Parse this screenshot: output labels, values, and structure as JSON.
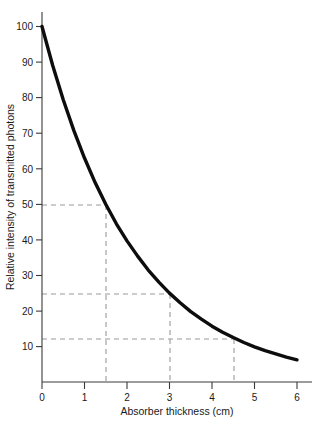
{
  "chart_data": {
    "type": "line",
    "title": "",
    "subtitle": "",
    "xlabel": "Absorber thickness (cm)",
    "ylabel": "Relative intensity of transmitted photons",
    "xlim": [
      0,
      6
    ],
    "ylim": [
      0,
      100
    ],
    "grid": false,
    "legend": false,
    "x_ticks": [
      0,
      1,
      2,
      3,
      4,
      5,
      6
    ],
    "x_tick_labels": [
      "0",
      "1",
      "2",
      "3",
      "4",
      "5",
      "6"
    ],
    "y_ticks": [
      10,
      20,
      30,
      40,
      50,
      60,
      70,
      80,
      90,
      100
    ],
    "y_tick_labels": [
      "10",
      "20",
      "30",
      "40",
      "50",
      "60",
      "70",
      "80",
      "90",
      "100"
    ],
    "series": [
      {
        "name": "Relative intensity of transmitted photons",
        "color": "#0d0d0d",
        "x": [
          0,
          0.25,
          0.5,
          0.75,
          1,
          1.25,
          1.5,
          1.75,
          2,
          2.25,
          2.5,
          2.75,
          3,
          3.25,
          3.5,
          3.75,
          4,
          4.25,
          4.5,
          4.75,
          5,
          5.25,
          5.5,
          5.75,
          6
        ],
        "y": [
          100,
          89.1,
          79.4,
          70.7,
          63,
          56.1,
          50,
          44.5,
          39.7,
          35.4,
          31.5,
          28.1,
          25,
          22.3,
          19.8,
          17.7,
          15.7,
          14,
          12.5,
          11.1,
          9.9,
          8.8,
          7.9,
          7,
          6.25
        ]
      }
    ],
    "annotations": {
      "guide_color": "#9a9a9a",
      "guide_style": "dashed",
      "half_value_layer_cm": 1.5,
      "guide_points": [
        {
          "label": "first half-value",
          "x": 1.5,
          "y": 50
        },
        {
          "label": "second half-value",
          "x": 3.0,
          "y": 25
        },
        {
          "label": "third half-value",
          "x": 4.5,
          "y": 12.5
        }
      ]
    }
  },
  "axes": {
    "x_title": "Absorber thickness (cm)",
    "y_title": "Relative intensity of transmitted photons",
    "x_tick_labels": [
      "0",
      "1",
      "2",
      "3",
      "4",
      "5",
      "6"
    ],
    "y_tick_labels": [
      "100",
      "90",
      "80",
      "70",
      "60",
      "50",
      "40",
      "30",
      "20",
      "10"
    ],
    "axis_color": "#3a3a3a"
  }
}
